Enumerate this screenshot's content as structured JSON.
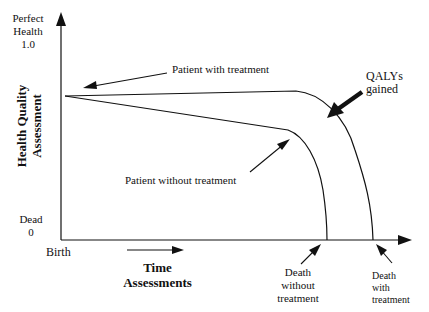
{
  "diagram": {
    "y_axis": {
      "top_label_line1": "Perfect",
      "top_label_line2": "Health",
      "top_value": "1.0",
      "title_line1": "Health Quality",
      "title_line2": "Assessment",
      "bottom_label": "Dead",
      "bottom_value": "0"
    },
    "x_axis": {
      "origin_label": "Birth",
      "title_line1": "Time",
      "title_line2": "Assessments"
    },
    "annotations": {
      "with_treatment": "Patient with treatment",
      "without_treatment": "Patient without treatment",
      "qalys_line1": "QALYs",
      "qalys_line2": "gained",
      "death_without_line1": "Death",
      "death_without_line2": "without",
      "death_without_line3": "treatment",
      "death_with_line1": "Death",
      "death_with_line2": "with",
      "death_with_line3": "treatment"
    },
    "colors": {
      "line": "#111111",
      "background": "#ffffff"
    }
  }
}
